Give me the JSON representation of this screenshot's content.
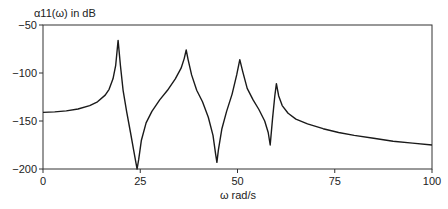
{
  "chart_data": {
    "type": "line",
    "title": "",
    "ylabel": "α11(ω) in dB",
    "xlabel": "ω rad/s",
    "xlim": [
      0,
      100
    ],
    "ylim": [
      -200,
      -50
    ],
    "x_ticks": [
      0,
      25,
      50,
      75,
      100
    ],
    "y_ticks": [
      -50,
      -100,
      -150,
      -200
    ],
    "x_tick_labels": [
      "0",
      "25",
      "50",
      "75",
      "100"
    ],
    "y_tick_labels": [
      "−50",
      "−100",
      "−150",
      "−200"
    ],
    "grid": false,
    "legend": null,
    "series": [
      {
        "name": "α11(ω)",
        "color": "#1a1a1a",
        "x": [
          0,
          3,
          6,
          9,
          12,
          14,
          16,
          17,
          18,
          18.7,
          19.3,
          19.9,
          20.6,
          21.5,
          22.5,
          23.3,
          23.9,
          24.2,
          24.6,
          25.3,
          26.5,
          28,
          30,
          32,
          34,
          35.5,
          36.3,
          36.8,
          37.3,
          38.2,
          39.5,
          41,
          42.5,
          43.7,
          44.4,
          44.7,
          45.1,
          46,
          47.2,
          48.6,
          49.8,
          50.6,
          51.3,
          52.5,
          54,
          55.5,
          57,
          57.9,
          58.4,
          59.0,
          59.6,
          60.0,
          60.6,
          61.5,
          63,
          65,
          68,
          72,
          76,
          80,
          85,
          90,
          95,
          100
        ],
        "y": [
          -141,
          -140.5,
          -139.5,
          -137.5,
          -134,
          -130,
          -123,
          -117,
          -106,
          -92,
          -66,
          -92,
          -118,
          -140,
          -162,
          -180,
          -194,
          -200,
          -190,
          -170,
          -152,
          -140,
          -128,
          -118,
          -106,
          -95,
          -85,
          -76,
          -86,
          -102,
          -118,
          -130,
          -146,
          -165,
          -185,
          -193,
          -180,
          -158,
          -140,
          -122,
          -102,
          -86,
          -98,
          -116,
          -128,
          -138,
          -150,
          -162,
          -175,
          -148,
          -124,
          -111,
          -124,
          -134,
          -142,
          -148,
          -153,
          -158,
          -162,
          -165,
          -168,
          -171,
          -173,
          -175
        ]
      }
    ]
  }
}
